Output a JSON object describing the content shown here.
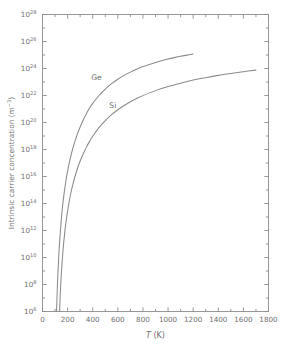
{
  "chart_data": {
    "type": "line",
    "title": "",
    "xlabel": "T (K)",
    "xlabel_symbol": "T",
    "xlabel_unit": "(K)",
    "ylabel": "Intrinsic carrier concentration (m−3)",
    "ylabel_main": "Intrinsic carrier concentration (m",
    "ylabel_exp": "−3",
    "ylabel_tail": ")",
    "xlim": [
      0,
      1800
    ],
    "ylim": [
      1000000.0,
      1e+28
    ],
    "yscale": "log",
    "xscale": "linear",
    "grid": false,
    "legend": "inline-labels",
    "xticks": [
      0,
      200,
      400,
      600,
      800,
      1000,
      1200,
      1400,
      1600,
      1800
    ],
    "xtick_labels": [
      "0",
      "200",
      "400",
      "600",
      "800",
      "1000",
      "1200",
      "1400",
      "1600",
      "1800"
    ],
    "xminor_step": 100,
    "ytick_exponents": [
      6,
      7,
      8,
      9,
      10,
      11,
      12,
      13,
      14,
      15,
      16,
      17,
      18,
      19,
      20,
      21,
      22,
      23,
      24,
      25,
      26,
      27,
      28
    ],
    "ytick_labeled_exponents": [
      6,
      8,
      10,
      12,
      14,
      16,
      18,
      20,
      22,
      24,
      26,
      28
    ],
    "ytick_label_base": "10",
    "curve_color": "#8a8a8a",
    "axis_color": "#8d8d8d",
    "series": [
      {
        "name": "Ge",
        "label": "Ge",
        "label_x": 430,
        "label_y": 1.3e+23,
        "points": [
          [
            112,
            1000000.0
          ],
          [
            120,
            180000000.0
          ],
          [
            130,
            16000000000.0
          ],
          [
            140,
            450000000000.0
          ],
          [
            150,
            7000000000000.0
          ],
          [
            160,
            65000000000000.0
          ],
          [
            175,
            900000000000000.0
          ],
          [
            190,
            7500000000000000.0
          ],
          [
            205,
            4.3e+16
          ],
          [
            220,
            1.9e+17
          ],
          [
            240,
            1.1e+18
          ],
          [
            260,
            4.6e+18
          ],
          [
            280,
            1.6e+19
          ],
          [
            300,
            4.6e+19
          ],
          [
            325,
            1.6e+20
          ],
          [
            350,
            4.6e+20
          ],
          [
            375,
            1.2e+21
          ],
          [
            400,
            2.6e+21
          ],
          [
            450,
            1e+22
          ],
          [
            500,
            3e+22
          ],
          [
            550,
            7.5e+22
          ],
          [
            600,
            1.6e+23
          ],
          [
            650,
            3.1e+23
          ],
          [
            700,
            5.4e+23
          ],
          [
            750,
            8.8e+23
          ],
          [
            800,
            1.4e+24
          ],
          [
            850,
            2e+24
          ],
          [
            900,
            2.8e+24
          ],
          [
            950,
            3.8e+24
          ],
          [
            1000,
            5e+24
          ],
          [
            1050,
            6.4e+24
          ],
          [
            1100,
            8e+24
          ],
          [
            1150,
            9.8e+24
          ],
          [
            1200,
            1.2e+25
          ]
        ]
      },
      {
        "name": "Si",
        "label": "Si",
        "label_x": 560,
        "label_y": 1.1e+21,
        "points": [
          [
            136,
            1000000.0
          ],
          [
            145,
            100000000.0
          ],
          [
            155,
            3000000000.0
          ],
          [
            165,
            50000000000.0
          ],
          [
            180,
            1200000000000.0
          ],
          [
            195,
            14000000000000.0
          ],
          [
            210,
            100000000000000.0
          ],
          [
            225,
            550000000000000.0
          ],
          [
            245,
            3400000000000000.0
          ],
          [
            265,
            1.6e+16
          ],
          [
            285,
            6e+16
          ],
          [
            300,
            1.4e+17
          ],
          [
            325,
            4.8e+17
          ],
          [
            350,
            1.5e+18
          ],
          [
            375,
            4e+18
          ],
          [
            400,
            9.5e+18
          ],
          [
            450,
            4.2e+19
          ],
          [
            500,
            1.4e+20
          ],
          [
            550,
            3.8e+20
          ],
          [
            600,
            8.8e+20
          ],
          [
            650,
            1.8e+21
          ],
          [
            700,
            3.4e+21
          ],
          [
            750,
            6e+21
          ],
          [
            800,
            9.8e+21
          ],
          [
            900,
            2.3e+22
          ],
          [
            1000,
            4.6e+22
          ],
          [
            1100,
            8.2e+22
          ],
          [
            1200,
            1.4e+23
          ],
          [
            1300,
            2.1e+23
          ],
          [
            1400,
            3.1e+23
          ],
          [
            1500,
            4.3e+23
          ],
          [
            1600,
            5.8e+23
          ],
          [
            1700,
            7.6e+23
          ]
        ]
      }
    ]
  }
}
